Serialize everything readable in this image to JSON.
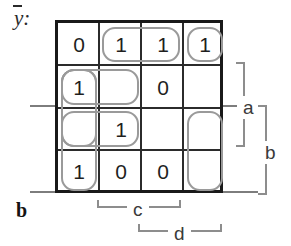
{
  "diagram": {
    "type": "karnaugh-map",
    "output_label": "y",
    "output_label_overbar": true,
    "output_label_suffix": ":",
    "grid": {
      "rows": 4,
      "cols": 4,
      "cells": [
        [
          "0",
          "1",
          "1",
          "1"
        ],
        [
          "1",
          "",
          "0",
          ""
        ],
        [
          "",
          "1",
          "",
          ""
        ],
        [
          "1",
          "0",
          "0",
          ""
        ]
      ]
    },
    "groups": [
      {
        "name": "group-row1-col2-col3",
        "row": 0,
        "col": 1,
        "rowspan": 1,
        "colspan": 2
      },
      {
        "name": "group-row1-col4",
        "row": 0,
        "col": 3,
        "rowspan": 1,
        "colspan": 1
      },
      {
        "name": "group-row2-row3-col1",
        "row": 1,
        "col": 0,
        "rowspan": 2,
        "colspan": 1
      },
      {
        "name": "group-row2-col1-col2",
        "row": 1,
        "col": 0,
        "rowspan": 1,
        "colspan": 2
      },
      {
        "name": "group-row3-col1-col2",
        "row": 2,
        "col": 0,
        "rowspan": 1,
        "colspan": 2
      },
      {
        "name": "group-row2-row4-col1",
        "row": 1,
        "col": 0,
        "rowspan": 3,
        "colspan": 1
      },
      {
        "name": "group-row3-row4-col4",
        "row": 2,
        "col": 3,
        "rowspan": 2,
        "colspan": 1
      }
    ],
    "axis_labels": {
      "right_inner": "a",
      "right_outer": "b",
      "bottom_inner": "c",
      "bottom_outer": "d",
      "bottom_left": "b"
    },
    "colors": {
      "grid_line": "#2b2b2b",
      "grid_border": "#191919",
      "group_loop": "#9a9a9a",
      "bracket": "#8d8d8d",
      "text": "#1f1f1f"
    }
  }
}
